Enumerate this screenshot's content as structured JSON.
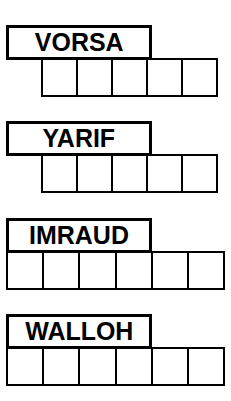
{
  "sheet": {
    "title": "Word Scramble Answer Grid",
    "ink_color": "#000000",
    "paper_color": "#ffffff"
  },
  "puzzles": [
    {
      "id": "puzzle-1",
      "word": "VORSA",
      "word_box": {
        "x": 6,
        "y": 25,
        "width": 146,
        "height": 35
      },
      "cell_row": {
        "x": 41,
        "y": 58,
        "cell_width": 37,
        "cell_height": 39,
        "count": 5
      },
      "letter_count": 5,
      "circled_cells": [
        5
      ],
      "cells": [
        {
          "index": 1,
          "letter": "",
          "circled": false
        },
        {
          "index": 2,
          "letter": "",
          "circled": false
        },
        {
          "index": 3,
          "letter": "",
          "circled": false
        },
        {
          "index": 4,
          "letter": "",
          "circled": false
        },
        {
          "index": 5,
          "letter": "",
          "circled": true
        }
      ]
    },
    {
      "id": "puzzle-2",
      "word": "YARIF",
      "word_box": {
        "x": 6,
        "y": 121,
        "width": 146,
        "height": 35
      },
      "cell_row": {
        "x": 41,
        "y": 154,
        "cell_width": 37,
        "cell_height": 39,
        "count": 5
      },
      "letter_count": 5,
      "circled_cells": [
        1,
        4
      ],
      "cells": [
        {
          "index": 1,
          "letter": "",
          "circled": true
        },
        {
          "index": 2,
          "letter": "",
          "circled": false
        },
        {
          "index": 3,
          "letter": "",
          "circled": false
        },
        {
          "index": 4,
          "letter": "",
          "circled": true
        },
        {
          "index": 5,
          "letter": "",
          "circled": false
        }
      ]
    },
    {
      "id": "puzzle-3",
      "word": "IMRAUD",
      "word_box": {
        "x": 6,
        "y": 218,
        "width": 146,
        "height": 35
      },
      "cell_row": {
        "x": 6,
        "y": 251,
        "cell_width": 38.2,
        "cell_height": 39,
        "count": 6
      },
      "letter_count": 6,
      "circled_cells": [
        3
      ],
      "cells": [
        {
          "index": 1,
          "letter": "",
          "circled": false
        },
        {
          "index": 2,
          "letter": "",
          "circled": false
        },
        {
          "index": 3,
          "letter": "",
          "circled": true
        },
        {
          "index": 4,
          "letter": "",
          "circled": false
        },
        {
          "index": 5,
          "letter": "",
          "circled": false
        },
        {
          "index": 6,
          "letter": "",
          "circled": false
        }
      ]
    },
    {
      "id": "puzzle-4",
      "word": "WALLOH",
      "word_box": {
        "x": 6,
        "y": 314,
        "width": 146,
        "height": 35
      },
      "cell_row": {
        "x": 6,
        "y": 347,
        "cell_width": 38.2,
        "cell_height": 39,
        "count": 6
      },
      "letter_count": 6,
      "circled_cells": [
        2,
        5,
        6
      ],
      "cells": [
        {
          "index": 1,
          "letter": "",
          "circled": false
        },
        {
          "index": 2,
          "letter": "",
          "circled": true
        },
        {
          "index": 3,
          "letter": "",
          "circled": false
        },
        {
          "index": 4,
          "letter": "",
          "circled": false
        },
        {
          "index": 5,
          "letter": "",
          "circled": true
        },
        {
          "index": 6,
          "letter": "",
          "circled": true
        }
      ]
    }
  ]
}
